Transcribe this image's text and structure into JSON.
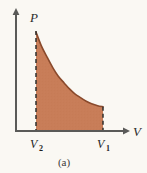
{
  "figure": {
    "caption": "(a)",
    "background_color": "#faf8f3"
  },
  "chart_data": {
    "type": "area",
    "title": "",
    "subtitle": "",
    "xlabel": "V",
    "ylabel": "P",
    "xlabel_full": "Volume",
    "ylabel_full": "Pressure",
    "grid": false,
    "legend": null,
    "axis_style": "arrow-tipped half axes",
    "x_tick_labels": [
      "V2",
      "V1"
    ],
    "x_tick_label_base": "V",
    "x_tick_label_subscripts": [
      "2",
      "1"
    ],
    "y_tick_labels": [],
    "xlim": [
      0,
      1
    ],
    "ylim": [
      0,
      1
    ],
    "x": [
      0.0,
      0.08,
      0.17,
      0.25,
      0.33,
      0.42,
      0.5,
      0.58,
      0.67,
      0.75,
      0.83,
      0.92,
      1.0
    ],
    "series": [
      {
        "name": "adiabatic expansion curve",
        "kind": "curve",
        "stroke_color": "#8a4a2c",
        "fill_color": "#c87d58",
        "values": [
          1.0,
          0.86,
          0.74,
          0.64,
          0.555,
          0.485,
          0.425,
          0.375,
          0.335,
          0.3,
          0.275,
          0.255,
          0.245
        ]
      }
    ],
    "annotations": [
      {
        "name": "left-boundary",
        "kind": "dashed-vertical-line",
        "x": 0.0,
        "y_from": 0.0,
        "y_to": 1.0,
        "label": "V2",
        "color": "#2b2b2b"
      },
      {
        "name": "right-boundary",
        "kind": "dashed-vertical-line",
        "x": 1.0,
        "y_from": 0.0,
        "y_to": 0.245,
        "label": "V1",
        "color": "#2b2b2b"
      },
      {
        "name": "shaded-work-area",
        "kind": "fill-under-curve",
        "color": "#c87d58"
      }
    ]
  },
  "colors": {
    "fill": "#c87d58",
    "curve_stroke": "#8b4a2b",
    "axis": "#5a5a58",
    "text": "#242424",
    "background": "#faf8f3"
  }
}
